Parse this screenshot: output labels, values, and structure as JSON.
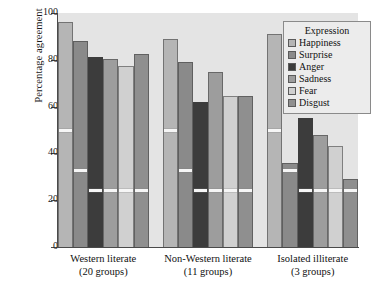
{
  "chart_data": {
    "type": "bar",
    "title": "",
    "xlabel": "",
    "ylabel": "Percentage agreement",
    "ylim": [
      0,
      100
    ],
    "yticks": [
      0,
      20,
      40,
      60,
      80,
      100
    ],
    "grid": false,
    "legend_position": "top-right",
    "legend_title": "Expression",
    "categories": [
      "Western literate\n(20 groups)",
      "Non-Western literate\n(11 groups)",
      "Isolated illiterate\n(3 groups)"
    ],
    "group_labels": [
      {
        "line1": "Western literate",
        "line2": "(20 groups)"
      },
      {
        "line1": "Non-Western literate",
        "line2": "(11 groups)"
      },
      {
        "line1": "Isolated illiterate",
        "line2": "(3 groups)"
      }
    ],
    "series": [
      {
        "name": "Happiness",
        "color": "#b5b5b5",
        "values": [
          96,
          89,
          91
        ]
      },
      {
        "name": "Surprise",
        "color": "#8a8a8a",
        "values": [
          88,
          79,
          36
        ]
      },
      {
        "name": "Anger",
        "color": "#3c3c3c",
        "values": [
          81,
          62,
          55
        ]
      },
      {
        "name": "Sadness",
        "color": "#9d9d9d",
        "values": [
          80.5,
          75,
          48
        ]
      },
      {
        "name": "Fear",
        "color": "#d0d0d0",
        "values": [
          77.5,
          64.5,
          43
        ]
      },
      {
        "name": "Disgust",
        "color": "#8f8f8f",
        "values": [
          82.5,
          64.5,
          29
        ]
      }
    ],
    "chance_lines": {
      "label": "chance level",
      "values": [
        50,
        32.5,
        24,
        24,
        24,
        24
      ]
    }
  },
  "axis": {
    "y_title": "Percentage agreement",
    "tick_labels": [
      "100",
      "80",
      "60",
      "40",
      "20",
      "0"
    ]
  },
  "legend": {
    "title": "Expression",
    "entries": [
      {
        "label": "Happiness"
      },
      {
        "label": "Surprise"
      },
      {
        "label": "Anger"
      },
      {
        "label": "Sadness"
      },
      {
        "label": "Fear"
      },
      {
        "label": "Disgust"
      }
    ]
  }
}
